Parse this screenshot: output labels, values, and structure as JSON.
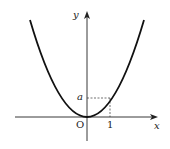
{
  "figure": {
    "type": "function-graph",
    "axes": {
      "x_label": "x",
      "y_label": "y",
      "origin_label": "O"
    },
    "ticks": {
      "x_tick_label": "1",
      "y_tick_label": "a"
    },
    "colors": {
      "curve": "#111111",
      "axes": "#222222",
      "guides": "#333333"
    }
  }
}
